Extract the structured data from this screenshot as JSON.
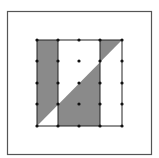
{
  "diagram": {
    "colors": {
      "background": "#ffffff",
      "frame": "#555555",
      "shade": "#8a8a8a",
      "grid_line": "#222222",
      "dot": "#111111"
    },
    "frame": {
      "x": 7,
      "y": 11,
      "width": 145,
      "height": 144
    },
    "grid": {
      "columns_x": [
        37,
        58,
        79,
        100,
        122
      ],
      "rows_y": [
        40,
        61,
        83,
        104,
        126
      ]
    },
    "diagonal": {
      "from": [
        37,
        126
      ],
      "to": [
        122,
        40
      ]
    },
    "shaded_regions": [
      {
        "name": "left-strip-above-diagonal",
        "points": "37,40 58,40 58,104.8 37,126"
      },
      {
        "name": "middle-below-diagonal",
        "points": "58,104.8 100,62.3 100,126 58,126"
      },
      {
        "name": "right-top-triangle",
        "points": "100,40 122,40 100,62.3"
      }
    ]
  }
}
